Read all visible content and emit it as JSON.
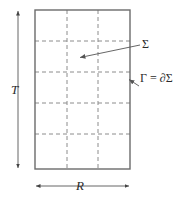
{
  "figure": {
    "type": "diagram",
    "caption_labels": {
      "height_dimension": "T",
      "width_dimension": "R",
      "interior_label": "Σ",
      "boundary_label": "Γ = ∂Σ"
    },
    "geometry": {
      "rectangle": {
        "x": 35,
        "y": 10,
        "width": 95,
        "height": 159
      },
      "grid_vertical_lines_x": [
        67,
        98
      ],
      "grid_horizontal_lines_y": [
        41,
        72,
        103,
        134
      ],
      "columns": 3,
      "rows": 5
    },
    "annotations": {
      "sigma_arrow": {
        "from_x": 140,
        "from_y": 45,
        "to_x": 78,
        "to_y": 58
      },
      "gamma_arrow": {
        "from_x": 138,
        "from_y": 85,
        "to_x": 128,
        "to_y": 79
      },
      "height_arrow": {
        "x": 18,
        "y1": 10,
        "y2": 169
      },
      "width_arrow": {
        "y": 186,
        "x1": 35,
        "x2": 130
      }
    },
    "colors": {
      "border": "#6b6b6b",
      "grid": "#8c8c8c",
      "arrow": "#555555",
      "text": "#2b2b2b",
      "background": "#ffffff"
    }
  }
}
